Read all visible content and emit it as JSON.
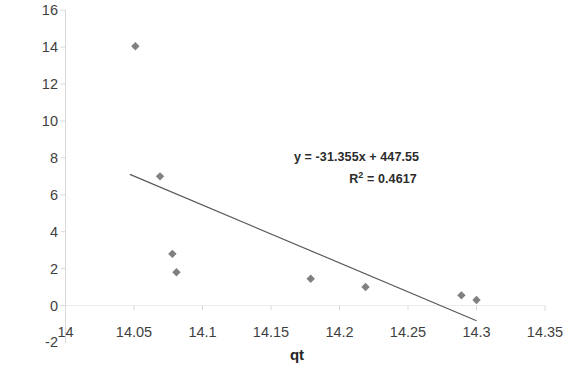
{
  "chart_data": {
    "type": "scatter",
    "title": "",
    "xlabel": "qt",
    "ylabel": "qt/t",
    "xlim": [
      14.0,
      14.35
    ],
    "ylim": [
      -2,
      16
    ],
    "xticks": [
      "14",
      "14.05",
      "14.1",
      "14.15",
      "14.2",
      "14.25",
      "14.3",
      "14.35"
    ],
    "xtick_values": [
      14.0,
      14.05,
      14.1,
      14.15,
      14.2,
      14.25,
      14.3,
      14.35
    ],
    "yticks": [
      "-2",
      "0",
      "2",
      "4",
      "6",
      "8",
      "10",
      "12",
      "14",
      "16"
    ],
    "ytick_values": [
      -2,
      0,
      2,
      4,
      6,
      8,
      10,
      12,
      14,
      16
    ],
    "grid": false,
    "legend": "none",
    "marker": "diamond",
    "marker_color": "#808080",
    "series": [
      {
        "name": "qt/t vs qt",
        "points": [
          {
            "x": 14.051,
            "y": 14.05
          },
          {
            "x": 14.069,
            "y": 7.0
          },
          {
            "x": 14.078,
            "y": 2.8
          },
          {
            "x": 14.081,
            "y": 1.8
          },
          {
            "x": 14.179,
            "y": 1.45
          },
          {
            "x": 14.219,
            "y": 1.0
          },
          {
            "x": 14.289,
            "y": 0.55
          },
          {
            "x": 14.3,
            "y": 0.3
          }
        ]
      }
    ],
    "trendline": {
      "type": "linear",
      "slope": -31.355,
      "intercept": 447.55,
      "r_squared": 0.4617,
      "x_start": 14.047,
      "x_end": 14.3,
      "color": "#595959"
    },
    "annotations": {
      "equation": "y = -31.355x + 447.55",
      "r_squared_label_prefix": "R",
      "r_squared_label_sup": "2",
      "r_squared_label_value": " = 0.4617"
    }
  },
  "axes": {
    "y_title": "qt/t",
    "x_title": "qt",
    "y_tick_labels": [
      "16",
      "14",
      "12",
      "10",
      "8",
      "6",
      "4",
      "2",
      "0",
      "-2"
    ],
    "x_tick_labels": [
      "14",
      "14.05",
      "14.1",
      "14.15",
      "14.2",
      "14.25",
      "14.3",
      "14.35"
    ]
  },
  "equation_text": {
    "line1": "y = -31.355x + 447.55",
    "line2_prefix": "R",
    "line2_sup": "2",
    "line2_rest": " = 0.4617"
  }
}
